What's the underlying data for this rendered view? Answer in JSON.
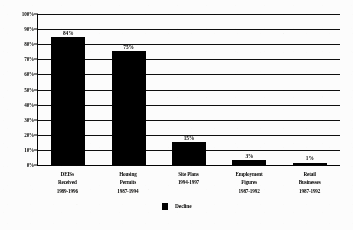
{
  "chart_data": {
    "type": "bar",
    "title": "",
    "xlabel": "",
    "ylabel": "",
    "ylim": [
      0,
      100
    ],
    "ytick_labels": [
      "100%",
      "90%",
      "80%",
      "70%",
      "60%",
      "50%",
      "40%",
      "30%",
      "20%",
      "10%",
      "0%"
    ],
    "ytick_values": [
      100,
      90,
      80,
      70,
      60,
      50,
      40,
      30,
      20,
      10,
      0
    ],
    "grid": true,
    "legend_position": "bottom-center",
    "categories": [
      "DEISs Received 1989-1996",
      "Housing Permits 1987-1994",
      "Site Plans 1994-1997",
      "Employment Figures 1987-1992",
      "Retail Businesses 1987-1992"
    ],
    "category_lines": [
      [
        "DEISs",
        "Received",
        "1989-1996"
      ],
      [
        "Housing",
        "Permits",
        "1987-1994"
      ],
      [
        "Site Plans",
        "1994-1997"
      ],
      [
        "Employment",
        "Figures",
        "1987-1992"
      ],
      [
        "Retail",
        "Businesses",
        "1987-1992"
      ]
    ],
    "values": [
      84,
      75,
      15,
      3,
      1
    ],
    "value_labels": [
      "84%",
      "75%",
      "15%",
      "3%",
      "1%"
    ],
    "series": [
      {
        "name": "Decline",
        "color": "#070707",
        "values": [
          84,
          75,
          15,
          3,
          1
        ]
      }
    ],
    "legend": [
      {
        "label": "Decline",
        "color": "#070707"
      }
    ]
  },
  "colors": {
    "bar": "#070707",
    "axis": "#111111",
    "gridline": "#1b1b1b",
    "text": "#0b0b0b",
    "background": "#fbfbfa"
  }
}
